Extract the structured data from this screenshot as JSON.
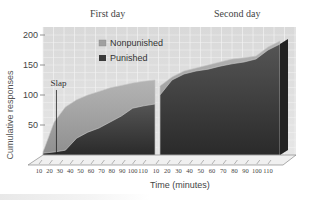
{
  "chart_data": {
    "type": "area",
    "title": "",
    "panels": [
      "First day",
      "Second day"
    ],
    "xlabel": "Time (minutes)",
    "ylabel": "Cumulative responses",
    "ylim": [
      0,
      200
    ],
    "yticks": [
      50,
      100,
      150,
      200
    ],
    "x": [
      10,
      20,
      30,
      40,
      50,
      60,
      70,
      80,
      90,
      100,
      110
    ],
    "xtick_labels": [
      "10",
      "20",
      "30",
      "40",
      "50",
      "60",
      "70",
      "80",
      "90",
      "100",
      "110"
    ],
    "grid": true,
    "legend": {
      "position": "upper-center-left",
      "entries": [
        "Nonpunished",
        "Punished"
      ]
    },
    "annotations": [
      {
        "text": "Slap",
        "day": "First day",
        "x": 22
      }
    ],
    "series": [
      {
        "name": "Nonpunished",
        "day": "First day",
        "color": "#a9a9a9",
        "values": [
          5,
          55,
          80,
          92,
          100,
          106,
          112,
          116,
          120,
          123,
          125
        ]
      },
      {
        "name": "Punished",
        "day": "First day",
        "color": "#3c3c3c",
        "values": [
          3,
          5,
          8,
          28,
          38,
          45,
          55,
          65,
          78,
          82,
          85
        ]
      },
      {
        "name": "Nonpunished",
        "day": "Second day",
        "color": "#a9a9a9",
        "values": [
          115,
          130,
          140,
          145,
          150,
          155,
          160,
          162,
          165,
          180,
          190
        ]
      },
      {
        "name": "Punished",
        "day": "Second day",
        "color": "#3c3c3c",
        "values": [
          100,
          125,
          135,
          140,
          143,
          148,
          152,
          155,
          160,
          175,
          185
        ]
      }
    ]
  },
  "labels": {
    "day1": "First day",
    "day2": "Second day",
    "xlabel": "Time (minutes)",
    "ylabel": "Cumulative responses",
    "legend_nonpunished": "Nonpunished",
    "legend_punished": "Punished",
    "slap": "Slap"
  }
}
